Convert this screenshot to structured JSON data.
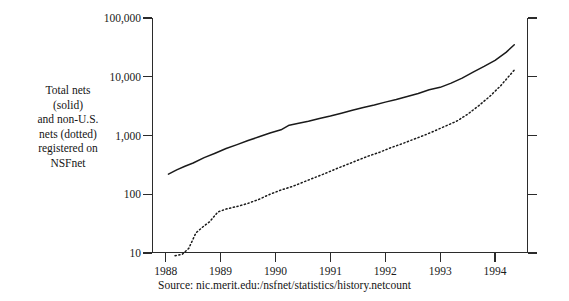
{
  "caption": {
    "lines": [
      "Total nets",
      "(solid)",
      "and non-U.S.",
      "nets (dotted)",
      "registered on",
      "NSFnet"
    ]
  },
  "source": {
    "text": "Source: nic.merit.edu:/nsfnet/statistics/history.netcount"
  },
  "chart_data": {
    "type": "line",
    "title": "",
    "subtitle": "",
    "xlabel": "",
    "ylabel": "Total nets (solid) and non-U.S. nets (dotted) registered on NSFnet",
    "yscale": "log",
    "ylim": [
      10,
      100000
    ],
    "xlim": [
      1987.75,
      1994.6
    ],
    "grid": false,
    "legend": "none",
    "y_ticks": [
      {
        "value": 10,
        "label": "10"
      },
      {
        "value": 100,
        "label": "100"
      },
      {
        "value": 1000,
        "label": "1,000"
      },
      {
        "value": 10000,
        "label": "10,000"
      },
      {
        "value": 100000,
        "label": "100,000"
      }
    ],
    "x_ticks": [
      {
        "value": 1988,
        "label": "1988"
      },
      {
        "value": 1989,
        "label": "1989"
      },
      {
        "value": 1990,
        "label": "1990"
      },
      {
        "value": 1991,
        "label": "1991"
      },
      {
        "value": 1992,
        "label": "1992"
      },
      {
        "value": 1993,
        "label": "1993"
      },
      {
        "value": 1994,
        "label": "1994"
      }
    ],
    "series": [
      {
        "name": "Total nets (solid)",
        "style": "solid",
        "color": "#1a1a1a",
        "x": [
          1988.05,
          1988.2,
          1988.35,
          1988.5,
          1988.7,
          1988.9,
          1989.1,
          1989.3,
          1989.5,
          1989.7,
          1989.9,
          1990.1,
          1990.25,
          1990.4,
          1990.6,
          1990.8,
          1991.0,
          1991.2,
          1991.4,
          1991.6,
          1991.8,
          1992.0,
          1992.2,
          1992.4,
          1992.6,
          1992.8,
          1993.0,
          1993.2,
          1993.4,
          1993.6,
          1993.8,
          1994.0,
          1994.2,
          1994.35
        ],
        "y": [
          220,
          260,
          300,
          340,
          420,
          500,
          600,
          700,
          820,
          950,
          1100,
          1250,
          1500,
          1600,
          1750,
          1950,
          2150,
          2400,
          2700,
          3000,
          3300,
          3700,
          4100,
          4600,
          5200,
          6000,
          6600,
          7800,
          9500,
          12000,
          15000,
          19000,
          26000,
          35000
        ]
      },
      {
        "name": "Non-U.S. nets (dotted)",
        "style": "dotted",
        "color": "#1a1a1a",
        "x": [
          1988.17,
          1988.3,
          1988.42,
          1988.55,
          1988.68,
          1988.8,
          1988.95,
          1989.1,
          1989.3,
          1989.5,
          1989.7,
          1989.9,
          1990.1,
          1990.3,
          1990.5,
          1990.7,
          1990.9,
          1991.1,
          1991.3,
          1991.5,
          1991.7,
          1991.9,
          1992.1,
          1992.3,
          1992.5,
          1992.7,
          1992.9,
          1993.1,
          1993.3,
          1993.5,
          1993.7,
          1993.9,
          1994.1,
          1994.35
        ],
        "y": [
          9,
          9.5,
          12,
          22,
          28,
          34,
          50,
          56,
          62,
          70,
          82,
          100,
          118,
          135,
          160,
          190,
          225,
          270,
          320,
          380,
          450,
          520,
          620,
          720,
          850,
          1000,
          1200,
          1450,
          1750,
          2300,
          3200,
          4600,
          7000,
          13000
        ]
      }
    ]
  }
}
